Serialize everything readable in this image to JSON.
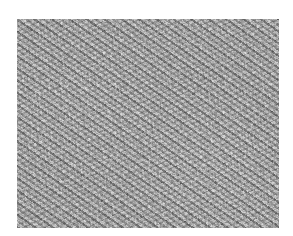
{
  "image": {
    "description": "Grayscale histology micrograph showing densely packed spindle-shaped cells with dark elongated nuclei in fascicular arrangement",
    "colors": {
      "background": "#ffffff",
      "tissue_mid": "#a9a9a9",
      "nuclei_dark": "#3c3c3c",
      "stroma_light": "#e6e6e6"
    }
  }
}
